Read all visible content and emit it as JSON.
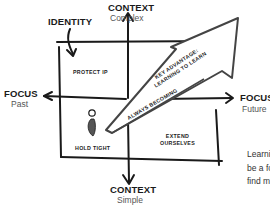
{
  "diagram": {
    "labels": {
      "identity": "IDENTITY",
      "context_top_title": "CONTEXT",
      "context_top_sub": "Complex",
      "context_bottom_title": "CONTEXT",
      "context_bottom_sub": "Simple",
      "focus_left_title": "FOCUS",
      "focus_left_sub": "Past",
      "focus_right_title": "FOCUS",
      "focus_right_sub": "Future"
    },
    "quadrants": {
      "top_left": "PROTECT IP",
      "bottom_left": "HOLD TIGHT",
      "bottom_right_line1": "EXTEND",
      "bottom_right_line2": "OURSELVES"
    },
    "big_arrow": {
      "line1": "KEY ADVANTAGE:",
      "line2": "LEARNING TO LEARN"
    },
    "inner_arrow_label": "ALWAYS BECOMING",
    "icons": {
      "person": "person-icon"
    },
    "colors": {
      "ink": "#1a1a1a",
      "arrow_outline": "#444444",
      "person_fill": "#555555"
    }
  },
  "side_text": {
    "line1": "Learni",
    "line2": "be a fo",
    "line3": "find m"
  }
}
